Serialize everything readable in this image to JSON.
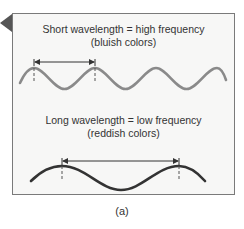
{
  "figure": {
    "label": "(a)",
    "short_wave": {
      "caption_line1": "Short wavelength = high frequency",
      "caption_line2": "(bluish colors)",
      "stroke_color": "#8a8a8a",
      "wavelength_px": 61
    },
    "long_wave": {
      "caption_line1": "Long wavelength = low frequency",
      "caption_line2": "(reddish colors)",
      "stroke_color": "#333333",
      "wavelength_px": 117
    },
    "colors": {
      "panel_border": "#7a7a7a",
      "panel_background": "#f7f7f6",
      "pointer": "#555555"
    }
  }
}
